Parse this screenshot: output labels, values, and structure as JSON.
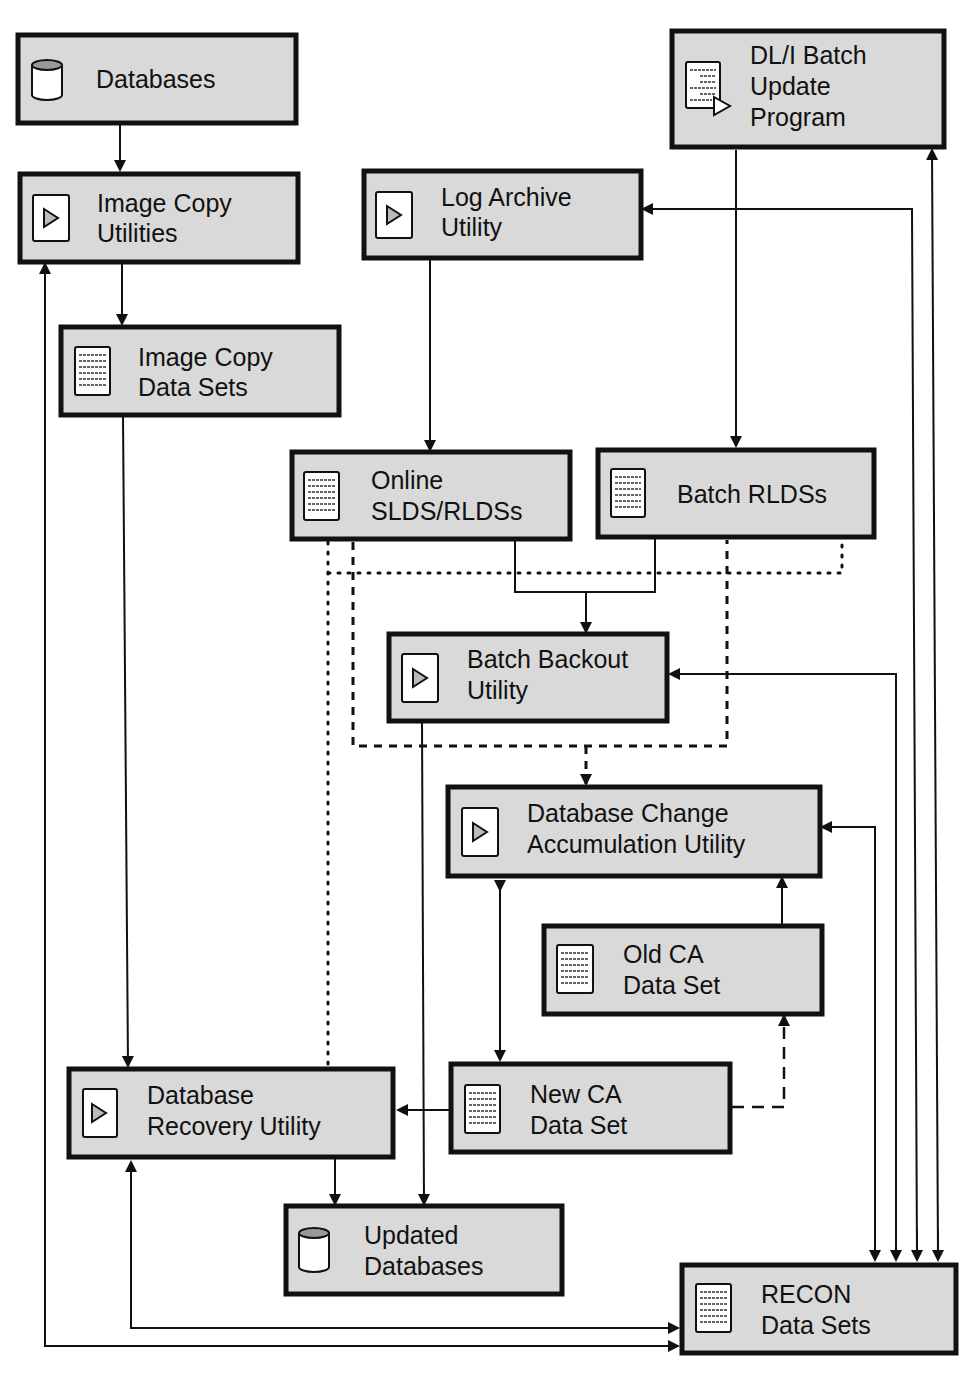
{
  "diagram": {
    "nodes": {
      "databases": {
        "line1": "Databases",
        "line2": "",
        "icon": "database-cylinder-icon"
      },
      "image_copy_utilities": {
        "line1": "Image Copy",
        "line2": "Utilities",
        "icon": "utility-play-icon"
      },
      "image_copy_data_sets": {
        "line1": "Image Copy",
        "line2": "Data Sets",
        "icon": "data-set-document-icon"
      },
      "log_archive_utility": {
        "line1": "Log Archive",
        "line2": "Utility",
        "icon": "utility-play-icon"
      },
      "dli_batch_update_program": {
        "line1": "DL/I Batch",
        "line2": "Update",
        "line3": "Program",
        "icon": "program-document-icon"
      },
      "online_slds_rldss": {
        "line1": "Online",
        "line2": "SLDS/RLDSs",
        "icon": "data-set-document-icon"
      },
      "batch_rldss": {
        "line1": "Batch RLDSs",
        "line2": "",
        "icon": "data-set-document-icon"
      },
      "batch_backout_utility": {
        "line1": "Batch Backout",
        "line2": "Utility",
        "icon": "utility-play-icon"
      },
      "db_change_accumulation_utility": {
        "line1": "Database Change",
        "line2": "Accumulation Utility",
        "icon": "utility-play-icon"
      },
      "old_ca_data_set": {
        "line1": "Old CA",
        "line2": "Data Set",
        "icon": "data-set-document-icon"
      },
      "new_ca_data_set": {
        "line1": "New CA",
        "line2": "Data Set",
        "icon": "data-set-document-icon"
      },
      "database_recovery_utility": {
        "line1": "Database",
        "line2": "Recovery Utility",
        "icon": "utility-play-icon"
      },
      "updated_databases": {
        "line1": "Updated",
        "line2": "Databases",
        "icon": "database-cylinder-icon"
      },
      "recon_data_sets": {
        "line1": "RECON",
        "line2": "Data Sets",
        "icon": "data-set-document-icon"
      }
    },
    "edges": [
      {
        "from": "Databases",
        "to": "Image Copy Utilities",
        "style": "solid"
      },
      {
        "from": "Image Copy Utilities",
        "to": "Image Copy Data Sets",
        "style": "solid"
      },
      {
        "from": "Image Copy Data Sets",
        "to": "Database Recovery Utility",
        "style": "solid"
      },
      {
        "from": "Log Archive Utility",
        "to": "Online SLDS/RLDSs",
        "style": "solid"
      },
      {
        "from": "DL/I Batch Update Program",
        "to": "Batch RLDSs",
        "style": "solid"
      },
      {
        "from": "Online SLDS/RLDSs",
        "to": "Batch Backout Utility",
        "style": "solid"
      },
      {
        "from": "Batch RLDSs",
        "to": "Batch Backout Utility",
        "style": "solid"
      },
      {
        "from": "Online SLDS/RLDSs + Batch RLDSs",
        "to": "Database Change Accumulation Utility",
        "style": "dashed"
      },
      {
        "from": "Online SLDS/RLDSs + Batch RLDSs",
        "to": "Database Recovery Utility",
        "style": "dotted"
      },
      {
        "from": "Batch Backout Utility",
        "to": "Updated Databases",
        "style": "solid"
      },
      {
        "from": "Database Change Accumulation Utility",
        "to": "New CA Data Set",
        "style": "bidirectional"
      },
      {
        "from": "Old CA Data Set",
        "to": "Database Change Accumulation Utility",
        "style": "solid"
      },
      {
        "from": "New CA Data Set",
        "to": "Old CA Data Set",
        "style": "dashed"
      },
      {
        "from": "New CA Data Set",
        "to": "Database Recovery Utility",
        "style": "solid"
      },
      {
        "from": "Database Recovery Utility",
        "to": "Updated Databases",
        "style": "solid"
      },
      {
        "from": "RECON Data Sets",
        "to": "Database Recovery Utility",
        "style": "bidirectional"
      },
      {
        "from": "RECON Data Sets",
        "to": "Image Copy Utilities",
        "style": "bidirectional"
      },
      {
        "from": "RECON Data Sets",
        "to": "Log Archive Utility",
        "style": "bidirectional"
      },
      {
        "from": "RECON Data Sets",
        "to": "DL/I Batch Update Program",
        "style": "bidirectional"
      },
      {
        "from": "RECON Data Sets",
        "to": "Batch Backout Utility",
        "style": "bidirectional"
      },
      {
        "from": "RECON Data Sets",
        "to": "Database Change Accumulation Utility",
        "style": "bidirectional"
      }
    ],
    "colors": {
      "box_fill": "#d9d9d9",
      "stroke": "#111111",
      "background": "#ffffff"
    }
  }
}
